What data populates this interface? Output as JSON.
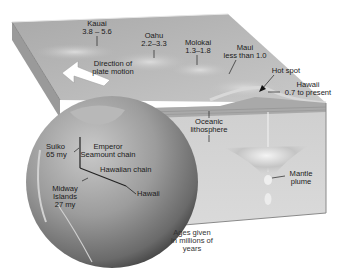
{
  "diagram": {
    "colors": {
      "background": "#ffffff",
      "block_top": "#b9b9b9",
      "block_front": "#d6d6d6",
      "block_left": "#9e9e9e",
      "lithosphere_band": "#a8a8a8",
      "globe_light": "#bdbdbd",
      "globe_dark": "#4a4a4a",
      "text": "#1a1a1a",
      "arrow_fill": "#ffffff"
    },
    "islands": [
      {
        "name": "Kauai",
        "age": "3.8 – 5.6"
      },
      {
        "name": "Oahu",
        "age": "2.2–3.3"
      },
      {
        "name": "Molokai",
        "age": "1.3–1.8"
      },
      {
        "name": "Maui",
        "age": "less than 1.0"
      },
      {
        "name": "Hawaii",
        "age": "0.7 to present"
      }
    ],
    "plate_motion": {
      "line1": "Direction of",
      "line2": "plate motion"
    },
    "hot_spot": "Hot spot",
    "lithosphere": {
      "line1": "Oceanic",
      "line2": "lithosphere"
    },
    "mantle_plume": {
      "line1": "Mantle",
      "line2": "plume"
    },
    "globe_labels": {
      "suiko": {
        "line1": "Suiko",
        "line2": "65 my"
      },
      "emperor": {
        "line1": "Emperor",
        "line2": "Seamount chain"
      },
      "hawaiian_chain": "Hawaiian chain",
      "hawaii": "Hawaii",
      "midway": {
        "line1": "Midway",
        "line2": "Islands",
        "line3": "27 my"
      }
    },
    "ages_note": {
      "line1": "Ages given",
      "line2": "in millions of",
      "line3": "years"
    }
  }
}
